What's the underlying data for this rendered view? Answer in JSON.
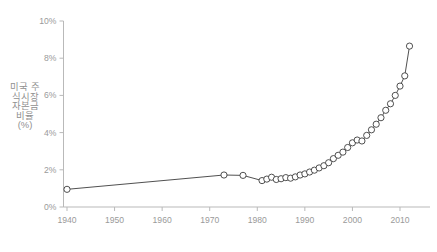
{
  "chart_data": {
    "type": "line",
    "title": "",
    "subtitle": "",
    "xlabel": "",
    "ylabel": "미국 주식시장 자본금 비율(%)",
    "xlim": [
      1938,
      2014
    ],
    "ylim": [
      0,
      10
    ],
    "xticks": [
      1940,
      1950,
      1960,
      1970,
      1980,
      1990,
      2000,
      2010
    ],
    "xtick_labels": [
      "1940",
      "1950",
      "1960",
      "1970",
      "1980",
      "1990",
      "2000",
      "2010"
    ],
    "yticks": [
      0,
      2,
      4,
      6,
      8,
      10
    ],
    "ytick_labels": [
      "0%",
      "2%",
      "4%",
      "6%",
      "8%",
      "10%"
    ],
    "grid": false,
    "legend": null,
    "marker": "open-circle",
    "series": [
      {
        "name": "미국 주식시장 자본금 비율(%)",
        "color": "#3c3c3c",
        "x": [
          1940,
          1973,
          1977,
          1981,
          1982,
          1983,
          1984,
          1985,
          1986,
          1987,
          1988,
          1989,
          1990,
          1991,
          1992,
          1993,
          1994,
          1995,
          1996,
          1997,
          1998,
          1999,
          2000,
          2001,
          2002,
          2003,
          2004,
          2005,
          2006,
          2007,
          2008,
          2009,
          2010,
          2011,
          2012
        ],
        "y": [
          0.95,
          1.72,
          1.7,
          1.42,
          1.5,
          1.6,
          1.48,
          1.52,
          1.58,
          1.55,
          1.62,
          1.72,
          1.78,
          1.88,
          1.98,
          2.1,
          2.22,
          2.38,
          2.6,
          2.78,
          2.95,
          3.2,
          3.45,
          3.6,
          3.55,
          3.85,
          4.15,
          4.45,
          4.8,
          5.2,
          5.55,
          6.0,
          6.5,
          7.05,
          8.65
        ]
      }
    ]
  },
  "axis": {
    "y_label_text": "미국 주식시장 자본금 비율(%)"
  }
}
